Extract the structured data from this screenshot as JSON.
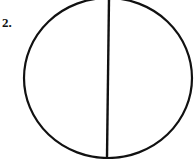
{
  "figure": {
    "label": "2.",
    "shape": "circle",
    "stroke_color": "#111111",
    "background_color": "#ffffff",
    "circle": {
      "cx": 108,
      "cy": 78,
      "rx": 84,
      "ry": 80
    },
    "line": {
      "x1": 109,
      "y1": -2,
      "x2": 107,
      "y2": 158
    }
  }
}
